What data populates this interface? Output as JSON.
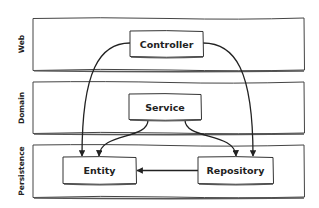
{
  "diagram": {
    "layers": [
      {
        "id": "web",
        "label": "Web"
      },
      {
        "id": "domain",
        "label": "Domain"
      },
      {
        "id": "persistence",
        "label": "Persistence"
      }
    ],
    "components": [
      {
        "id": "controller",
        "label": "Controller",
        "layer": "web"
      },
      {
        "id": "service",
        "label": "Service",
        "layer": "domain"
      },
      {
        "id": "entity",
        "label": "Entity",
        "layer": "persistence"
      },
      {
        "id": "repository",
        "label": "Repository",
        "layer": "persistence"
      }
    ],
    "edges": [
      {
        "from": "controller",
        "to": "entity"
      },
      {
        "from": "controller",
        "to": "repository"
      },
      {
        "from": "service",
        "to": "entity"
      },
      {
        "from": "service",
        "to": "repository"
      },
      {
        "from": "repository",
        "to": "entity"
      }
    ],
    "colors": {
      "stroke": "#333333",
      "fill": "#ffffff",
      "text": "#222222"
    }
  }
}
